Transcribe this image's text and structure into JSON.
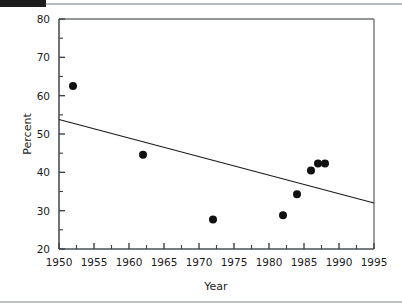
{
  "page": {
    "background_color": "#ffffff",
    "ink_color": "#1b1b1b",
    "rule_color": "#b9bcbe"
  },
  "chart_data": {
    "type": "scatter",
    "title": "",
    "xlabel": "Year",
    "ylabel": "Percent",
    "xlim": [
      1950,
      1995
    ],
    "ylim": [
      20,
      80
    ],
    "xticks": [
      1950,
      1955,
      1960,
      1965,
      1970,
      1975,
      1980,
      1985,
      1990,
      1995
    ],
    "xtick_labels": [
      "1950",
      "1955",
      "1960",
      "1965",
      "1970",
      "1975",
      "1980",
      "1985",
      "1990",
      "1995"
    ],
    "x_minor_tick_interval": 2.5,
    "yticks": [
      20,
      30,
      40,
      50,
      60,
      70,
      80
    ],
    "ytick_labels": [
      "20",
      "30",
      "40",
      "50",
      "60",
      "70",
      "80"
    ],
    "y_minor_tick_interval": 5,
    "grid": false,
    "legend": "none",
    "marker": {
      "shape": "circle",
      "color": "#101010",
      "size_px": 8
    },
    "points": [
      {
        "x": 1952,
        "y": 62.5
      },
      {
        "x": 1962,
        "y": 44.6
      },
      {
        "x": 1972,
        "y": 27.7
      },
      {
        "x": 1982,
        "y": 28.8
      },
      {
        "x": 1984,
        "y": 34.3
      },
      {
        "x": 1986,
        "y": 40.5
      },
      {
        "x": 1987,
        "y": 42.3
      },
      {
        "x": 1988,
        "y": 42.3
      }
    ],
    "series": [
      {
        "name": "Percent",
        "type": "scatter",
        "x": [
          1952,
          1962,
          1972,
          1982,
          1984,
          1986,
          1987,
          1988
        ],
        "values": [
          62.5,
          44.6,
          27.7,
          28.8,
          34.3,
          40.5,
          42.3,
          42.3
        ]
      },
      {
        "name": "Trend line",
        "type": "line",
        "x": [
          1950,
          1995
        ],
        "values": [
          53.8,
          32.0
        ],
        "color": "#1b1b1b",
        "width_px": 1.1
      }
    ],
    "annotations": []
  }
}
